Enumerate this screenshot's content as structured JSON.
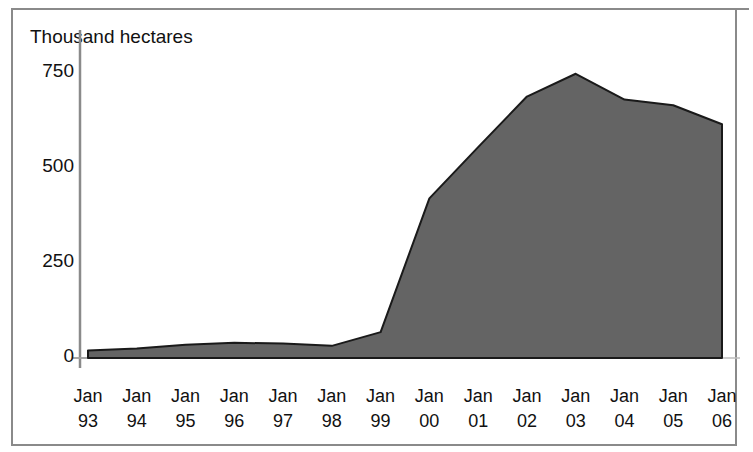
{
  "figure": {
    "axis_title": "Thousand hectares",
    "frame_color": "#8a8a8a",
    "background": "#ffffff"
  },
  "chart_data": {
    "type": "area",
    "title": "",
    "subtitle": "",
    "xlabel": "",
    "ylabel": "Thousand hectares",
    "categories": [
      "Jan 93",
      "Jan 94",
      "Jan 95",
      "Jan 96",
      "Jan 97",
      "Jan 98",
      "Jan 99",
      "Jan 00",
      "Jan 01",
      "Jan 02",
      "Jan 03",
      "Jan 04",
      "Jan 05",
      "Jan 06"
    ],
    "x_tick_lines": [
      {
        "month": "Jan",
        "year": "93"
      },
      {
        "month": "Jan",
        "year": "94"
      },
      {
        "month": "Jan",
        "year": "95"
      },
      {
        "month": "Jan",
        "year": "96"
      },
      {
        "month": "Jan",
        "year": "97"
      },
      {
        "month": "Jan",
        "year": "98"
      },
      {
        "month": "Jan",
        "year": "99"
      },
      {
        "month": "Jan",
        "year": "00"
      },
      {
        "month": "Jan",
        "year": "01"
      },
      {
        "month": "Jan",
        "year": "02"
      },
      {
        "month": "Jan",
        "year": "03"
      },
      {
        "month": "Jan",
        "year": "04"
      },
      {
        "month": "Jan",
        "year": "05"
      },
      {
        "month": "Jan",
        "year": "06"
      }
    ],
    "values": [
      20,
      25,
      35,
      40,
      38,
      32,
      68,
      420,
      555,
      688,
      748,
      680,
      665,
      615
    ],
    "series": [
      {
        "name": "Area",
        "values": [
          20,
          25,
          35,
          40,
          38,
          32,
          68,
          420,
          555,
          688,
          748,
          680,
          665,
          615
        ],
        "fill_color": "#646464",
        "line_color": "#1a1a1a"
      }
    ],
    "yticks": [
      0,
      250,
      500,
      750
    ],
    "ytick_labels": [
      "0",
      "250",
      "500",
      "750"
    ],
    "ylim": [
      0,
      790
    ],
    "grid": false,
    "legend": false,
    "legend_position": "none"
  }
}
